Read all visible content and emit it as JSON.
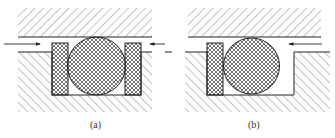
{
  "figure": {
    "type": "seal-groove-cross-section",
    "panels": [
      {
        "id": "a",
        "caption": "(a)",
        "components": [
          "housing-top",
          "housing-bottom",
          "groove",
          "o-ring",
          "backup-ring-left",
          "backup-ring-right"
        ],
        "pressure_arrows": [
          "left-to-right",
          "right-to-left"
        ]
      },
      {
        "id": "b",
        "caption": "(b)",
        "components": [
          "housing-top",
          "housing-bottom",
          "groove",
          "o-ring",
          "backup-ring-left"
        ],
        "pressure_arrows": [
          "right-to-left"
        ]
      }
    ],
    "colors": {
      "line": "#222222",
      "hatch": "#555555",
      "background": "#ffffff"
    }
  }
}
